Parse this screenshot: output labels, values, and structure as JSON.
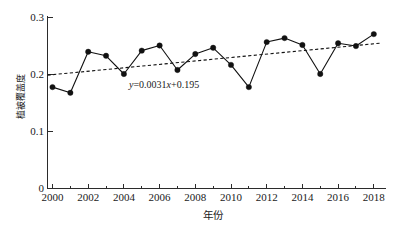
{
  "chart_data": {
    "type": "line",
    "title": "",
    "subtitle": "",
    "xlabel": "年份",
    "ylabel": "植被覆盖度",
    "x": [
      2000,
      2001,
      2002,
      2003,
      2004,
      2005,
      2006,
      2007,
      2008,
      2009,
      2010,
      2011,
      2012,
      2013,
      2014,
      2015,
      2016,
      2017,
      2018
    ],
    "values": [
      0.177,
      0.167,
      0.239,
      0.232,
      0.2,
      0.241,
      0.25,
      0.207,
      0.235,
      0.246,
      0.216,
      0.177,
      0.256,
      0.263,
      0.251,
      0.2,
      0.254,
      0.249,
      0.27
    ],
    "series": [
      {
        "name": "植被覆盖度",
        "values": [
          0.177,
          0.167,
          0.239,
          0.232,
          0.2,
          0.241,
          0.25,
          0.207,
          0.235,
          0.246,
          0.216,
          0.177,
          0.256,
          0.263,
          0.251,
          0.2,
          0.254,
          0.249,
          0.27
        ]
      }
    ],
    "trendline": {
      "type": "linear",
      "equation": "y=0.0031x+0.195",
      "slope": 0.0031,
      "intercept": 0.195,
      "style": "dashed",
      "y_start": 0.198,
      "y_end": 0.254
    },
    "ylim": [
      0,
      0.3
    ],
    "xlim": [
      1999.4,
      2018.6
    ],
    "yticks": [
      0,
      0.1,
      0.2,
      0.3
    ],
    "ytick_labels": [
      "0",
      "0.1",
      "0.2",
      "0.3"
    ],
    "xticks": [
      2000,
      2002,
      2004,
      2006,
      2008,
      2010,
      2012,
      2014,
      2016,
      2018
    ],
    "xtick_labels": [
      "2000",
      "2002",
      "2004",
      "2006",
      "2008",
      "2010",
      "2012",
      "2014",
      "2016",
      "2018"
    ],
    "xticks_minor": [
      2001,
      2003,
      2005,
      2007,
      2009,
      2011,
      2013,
      2015,
      2017
    ],
    "grid": false,
    "legend": null,
    "marker": "filled-circle",
    "line_color": "#111111",
    "marker_color": "#111111",
    "trend_color": "#111111",
    "background_color": "#ffffff"
  },
  "annotations": {
    "equation_text": "y=0.0031x+0.195",
    "equation_var": "y",
    "equation_rest": "=0.0031",
    "equation_x": "x",
    "equation_tail": "+0.195"
  },
  "axes": {
    "y_axis_name": "植被覆盖度",
    "x_axis_name": "年份"
  }
}
